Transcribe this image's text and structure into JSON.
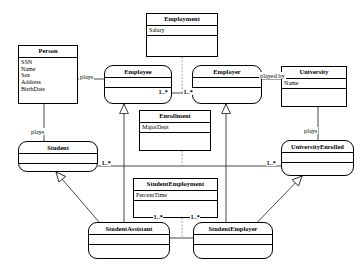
{
  "diagram": {
    "line_color": "#1a1a1a",
    "fill_color": "#ffffff",
    "classes": [
      {
        "id": "person",
        "name": "Person",
        "shape": "rect",
        "attributes": [
          "SSN",
          "Name",
          "Sex",
          "Address",
          "BirthDate"
        ],
        "operations": []
      },
      {
        "id": "employment",
        "name": "Employment",
        "shape": "rect",
        "attributes": [
          "Salary"
        ],
        "operations": []
      },
      {
        "id": "employee",
        "name": "Employee",
        "shape": "role",
        "attributes": [],
        "operations": []
      },
      {
        "id": "employer",
        "name": "Employer",
        "shape": "role",
        "attributes": [],
        "operations": []
      },
      {
        "id": "university",
        "name": "University",
        "shape": "rect",
        "attributes": [
          "Name"
        ],
        "operations": []
      },
      {
        "id": "enrollment",
        "name": "Enrollment",
        "shape": "rect",
        "attributes": [
          "MajorDept"
        ],
        "operations": []
      },
      {
        "id": "student",
        "name": "Student",
        "shape": "role",
        "attributes": [],
        "operations": []
      },
      {
        "id": "university-enrolled",
        "name": "UniversityEnrolled",
        "shape": "role",
        "attributes": [],
        "operations": []
      },
      {
        "id": "student-employment",
        "name": "StudentEmployment",
        "shape": "rect",
        "attributes": [
          "PercentTime"
        ],
        "operations": []
      },
      {
        "id": "student-assistant",
        "name": "StudentAssistant",
        "shape": "role",
        "attributes": [],
        "operations": []
      },
      {
        "id": "student-employer",
        "name": "StudentEmployer",
        "shape": "role",
        "attributes": [],
        "operations": []
      }
    ],
    "association_labels": [
      {
        "id": "plays-employee",
        "text": "plays"
      },
      {
        "id": "plays-student",
        "text": "plays"
      },
      {
        "id": "played-by-university",
        "text": "played by"
      },
      {
        "id": "plays-university-enrolled",
        "text": "plays"
      }
    ],
    "multiplicities": [
      {
        "id": "employee-mult",
        "text": "1..*"
      },
      {
        "id": "employer-mult",
        "text": "1..*"
      },
      {
        "id": "student-mult",
        "text": "1..*"
      },
      {
        "id": "university-enrolled-mult",
        "text": "1..*"
      },
      {
        "id": "student-assistant-mult",
        "text": "1..*"
      },
      {
        "id": "student-employer-mult",
        "text": "1..*"
      }
    ]
  }
}
